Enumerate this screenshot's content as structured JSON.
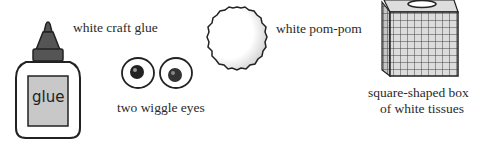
{
  "items": [
    {
      "id": "glue",
      "label": "white craft glue",
      "bottle_text": "glue"
    },
    {
      "id": "eyes",
      "label": "two wiggle eyes"
    },
    {
      "id": "pompom",
      "label": "white pom-pom"
    },
    {
      "id": "tissues",
      "label_line1": "square-shaped box",
      "label_line2": "of white tissues"
    }
  ],
  "colors": {
    "ink": "#222222",
    "cap": "#555555",
    "label_bg": "#c8c8c8",
    "box_fill": "#d9d9d9"
  }
}
